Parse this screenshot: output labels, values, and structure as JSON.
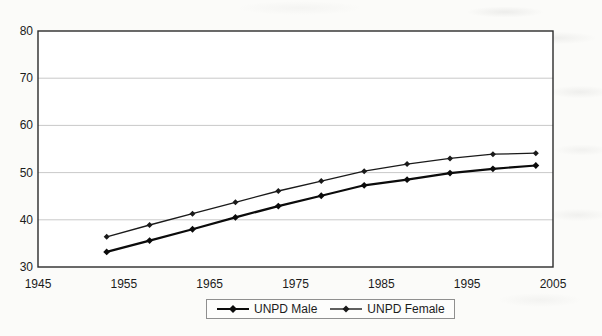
{
  "chart_data": {
    "type": "line",
    "title": "",
    "xlabel": "",
    "ylabel": "",
    "x": [
      1953,
      1958,
      1963,
      1968,
      1973,
      1978,
      1983,
      1988,
      1993,
      1998,
      2003
    ],
    "series": [
      {
        "name": "UNPD Male",
        "marker": "diamond",
        "color": "#0b0b0b",
        "line_width": 2.2,
        "values": [
          33.2,
          35.6,
          38.0,
          40.5,
          42.9,
          45.1,
          47.3,
          48.5,
          49.9,
          50.8,
          51.5
        ]
      },
      {
        "name": "UNPD Female",
        "marker": "diamond",
        "color": "#1a1a1a",
        "line_width": 1.3,
        "values": [
          36.4,
          38.9,
          41.3,
          43.7,
          46.1,
          48.2,
          50.3,
          51.8,
          53.0,
          53.9,
          54.1
        ]
      }
    ],
    "xlim": [
      1945,
      2005
    ],
    "ylim": [
      30,
      80
    ],
    "x_ticks": [
      1945,
      1955,
      1965,
      1975,
      1985,
      1995,
      2005
    ],
    "y_ticks": [
      30,
      40,
      50,
      60,
      70,
      80
    ],
    "grid": "horizontal",
    "gridline_color": "#c9c9c9",
    "axis_color": "#2b2b2b",
    "plot_background": "#ffffff",
    "legend_position": "bottom-center"
  }
}
